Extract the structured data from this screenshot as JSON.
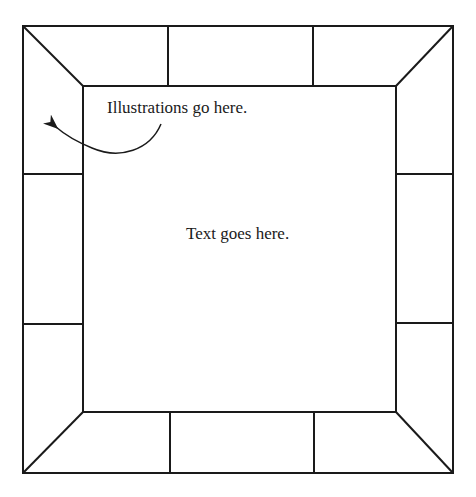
{
  "diagram": {
    "type": "page-layout-frame",
    "illustration_label": "Illustrations go here.",
    "text_label": "Text goes here.",
    "line_color": "#1a1a1a",
    "outer_box": {
      "x1": 23,
      "y1": 26,
      "x2": 453,
      "y2": 473
    },
    "inner_box": {
      "x1": 83,
      "y1": 86,
      "x2": 396,
      "y2": 412
    },
    "border_panels": {
      "top": 3,
      "bottom": 3,
      "left": 3,
      "right": 3
    }
  }
}
